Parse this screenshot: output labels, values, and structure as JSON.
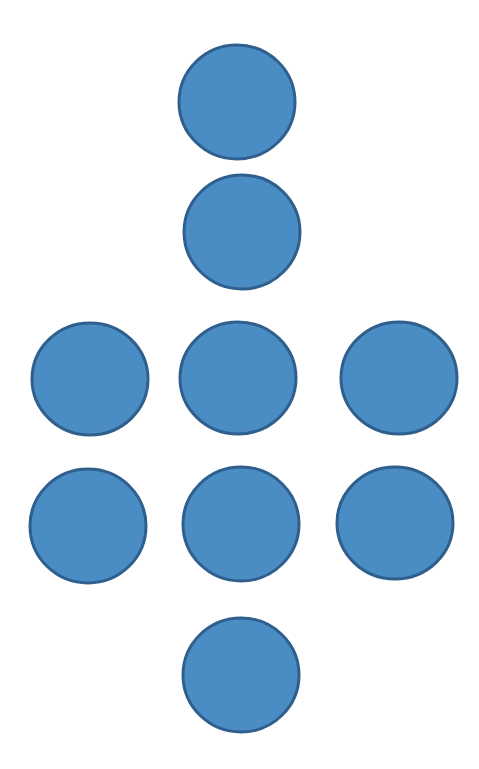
{
  "diagram": {
    "background": "#ffffff",
    "fill_color": "#4a8cc4",
    "stroke_color": "#2f5f8c",
    "stroke_width": 3,
    "circles": [
      {
        "id": "circle-1",
        "cx": 237,
        "cy": 102,
        "rx": 58,
        "ry": 57
      },
      {
        "id": "circle-2",
        "cx": 242,
        "cy": 232,
        "rx": 58,
        "ry": 57
      },
      {
        "id": "circle-3",
        "cx": 90,
        "cy": 379,
        "rx": 58,
        "ry": 56
      },
      {
        "id": "circle-4",
        "cx": 238,
        "cy": 378,
        "rx": 58,
        "ry": 56
      },
      {
        "id": "circle-5",
        "cx": 399,
        "cy": 378,
        "rx": 58,
        "ry": 56
      },
      {
        "id": "circle-6",
        "cx": 88,
        "cy": 526,
        "rx": 58,
        "ry": 57
      },
      {
        "id": "circle-7",
        "cx": 241,
        "cy": 524,
        "rx": 58,
        "ry": 57
      },
      {
        "id": "circle-8",
        "cx": 395,
        "cy": 523,
        "rx": 58,
        "ry": 56
      },
      {
        "id": "circle-9",
        "cx": 241,
        "cy": 675,
        "rx": 58,
        "ry": 57
      }
    ]
  }
}
